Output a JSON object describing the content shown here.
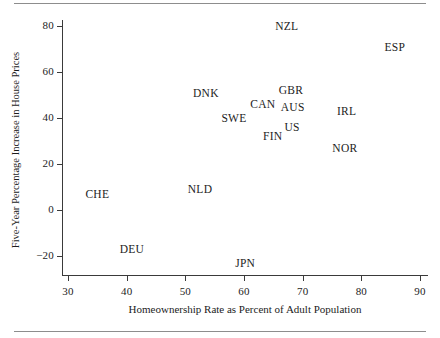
{
  "figure": {
    "has_top_rule": true,
    "has_bottom_rule": true,
    "rule_color": "#8d8d8d",
    "axis_color": "#3a3a3a",
    "text_color": "#1c1c1c",
    "background": "#ffffff"
  },
  "chart_data": {
    "type": "scatter",
    "title": "",
    "xlabel": "Homeownership Rate as Percent of Adult Population",
    "ylabel": "Five-Year Percentage Increase in House Prices",
    "xlim": [
      28,
      91
    ],
    "ylim": [
      -23,
      83
    ],
    "xticks": [
      30,
      40,
      50,
      60,
      70,
      80,
      90
    ],
    "xtick_labels": [
      "30",
      "40",
      "50",
      "60",
      "70",
      "80",
      "90"
    ],
    "yticks": [
      -20,
      0,
      20,
      40,
      60,
      80
    ],
    "ytick_labels": [
      "−20",
      "0",
      "20",
      "40",
      "60",
      "80"
    ],
    "grid": false,
    "legend": false,
    "marker_style": "text-label-only",
    "points": [
      {
        "label": "NZL",
        "x": 67.3,
        "y": 80.0
      },
      {
        "label": "ESP",
        "x": 85.7,
        "y": 71.0
      },
      {
        "label": "GBR",
        "x": 68.0,
        "y": 52.0
      },
      {
        "label": "DNK",
        "x": 53.5,
        "y": 51.0
      },
      {
        "label": "CAN",
        "x": 63.2,
        "y": 46.0
      },
      {
        "label": "AUS",
        "x": 68.3,
        "y": 45.0
      },
      {
        "label": "IRL",
        "x": 77.5,
        "y": 43.0
      },
      {
        "label": "SWE",
        "x": 58.3,
        "y": 40.0
      },
      {
        "label": "US",
        "x": 68.2,
        "y": 36.0
      },
      {
        "label": "FIN",
        "x": 64.9,
        "y": 32.0
      },
      {
        "label": "NOR",
        "x": 77.2,
        "y": 27.0
      },
      {
        "label": "NLD",
        "x": 52.5,
        "y": 9.0
      },
      {
        "label": "CHE",
        "x": 35.0,
        "y": 7.0
      },
      {
        "label": "DEU",
        "x": 40.9,
        "y": -17.0
      },
      {
        "label": "JPN",
        "x": 60.2,
        "y": -23.0
      }
    ]
  }
}
